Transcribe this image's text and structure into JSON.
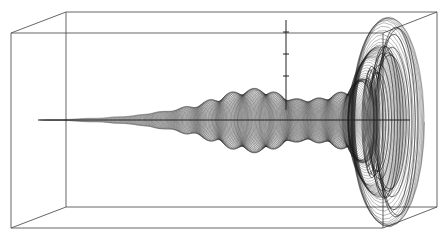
{
  "figure": {
    "colors": {
      "background": "#ffffff",
      "ink": "#1a1a1a",
      "box": "#555555"
    },
    "box": {
      "front": {
        "x1": 11,
        "y1": 33,
        "x2": 383,
        "y2": 228
      },
      "back": {
        "x1": 66,
        "y1": 12,
        "x2": 437,
        "y2": 207
      }
    },
    "axes": {
      "horizontal": {
        "x1": 38,
        "x2": 410,
        "y": 120
      },
      "vertical": {
        "x": 286,
        "y1": 20,
        "y2": 110,
        "ticks_y": [
          32,
          54,
          76
        ]
      }
    },
    "envelope": {
      "x": [
        60,
        100,
        130,
        160,
        190,
        215,
        235,
        255,
        270,
        285,
        300,
        320,
        345,
        365,
        380,
        392,
        400,
        405
      ],
      "half_height": [
        0.5,
        2,
        4,
        8,
        13,
        20,
        27,
        30,
        28,
        22,
        20,
        21,
        27,
        40,
        60,
        82,
        95,
        100
      ]
    }
  }
}
